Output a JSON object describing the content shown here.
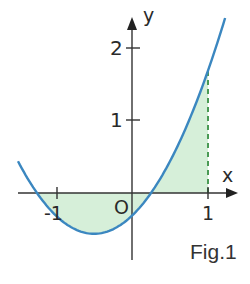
{
  "figure": {
    "caption": "Fig.1",
    "axis_x_label": "x",
    "axis_y_label": "y",
    "origin_label": "O",
    "x_ticks": [
      {
        "value": -1,
        "label": "-1"
      },
      {
        "value": 1,
        "label": "1"
      }
    ],
    "y_ticks": [
      {
        "value": 1,
        "label": "1"
      },
      {
        "value": 2,
        "label": "2"
      }
    ],
    "colors": {
      "curve": "#3b87c0",
      "fill": "#d6efd9",
      "dashed_line": "#4a9a55",
      "axes": "#333333"
    }
  },
  "chart_data": {
    "type": "line",
    "title": "",
    "caption": "Fig.1",
    "xlabel": "x",
    "ylabel": "y",
    "function": "y = x^2 + x - 5/16 (approx. parabola through roots x≈-1.25 and x≈0.25)",
    "x": [
      -1.5,
      -1.25,
      -1.0,
      -0.5,
      0.0,
      0.25,
      0.5,
      1.0,
      1.22
    ],
    "series": [
      {
        "name": "curve",
        "values": [
          0.44,
          0.0,
          -0.31,
          -0.56,
          -0.31,
          0.0,
          0.44,
          1.69,
          2.4
        ]
      }
    ],
    "shaded_region": {
      "from_x": -1.25,
      "to_x": 1.0,
      "between": "curve and x-axis"
    },
    "vertical_dashed_line": {
      "x": 1.0
    },
    "x_ticks": [
      -1,
      1
    ],
    "y_ticks": [
      1,
      2
    ],
    "xlim": [
      -1.5,
      1.35
    ],
    "ylim": [
      -0.9,
      2.5
    ],
    "grid": false,
    "legend": null
  }
}
